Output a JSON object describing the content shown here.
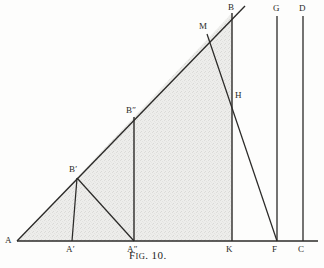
{
  "figure": {
    "caption_prefix": "F",
    "caption_smallcaps": "IG",
    "caption_suffix": ". 10.",
    "caption_full": "Fig. 10.",
    "ink_color": "#2b2a28",
    "fill_color": "#e9e9e7",
    "paper_color": "#fdfdfc"
  },
  "labels": {
    "A": "A",
    "A_prime": "A′",
    "A_double_prime": "A″",
    "B": "B",
    "B_prime": "B′",
    "B_double_prime": "B″",
    "M": "M",
    "H": "H",
    "K": "K",
    "F": "F",
    "C": "C",
    "G": "G",
    "D": "D"
  },
  "geometry": {
    "points": {
      "A": [
        17,
        241
      ],
      "A_prime": [
        72,
        241
      ],
      "A_double_prime": [
        134,
        241
      ],
      "K": [
        232,
        241
      ],
      "F": [
        277,
        241
      ],
      "C": [
        303,
        241
      ],
      "B_prime": [
        78,
        177
      ],
      "B_double_prime": [
        134,
        118
      ],
      "M": [
        207,
        33
      ],
      "B": [
        232,
        13
      ],
      "H": [
        232,
        96
      ],
      "G_top": [
        277,
        16
      ],
      "D_top": [
        303,
        16
      ],
      "ray_end": [
        245,
        6
      ],
      "axis_end": [
        318,
        241
      ]
    },
    "shaded_polygon": "17,241 232,13 232,241",
    "notes": "Right triangle A-B-K shaded; verticals at A', B''-A'', B-K, F-G, C-D; diagonals B'-A'' and M-F."
  }
}
